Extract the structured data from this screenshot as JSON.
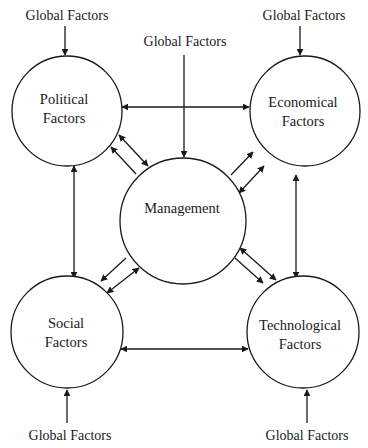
{
  "diagram": {
    "type": "concept-map",
    "nodes": [
      {
        "id": "political",
        "lines": [
          "Political",
          "Factors"
        ],
        "cx": 67,
        "cy": 111,
        "r": 55
      },
      {
        "id": "economical",
        "lines": [
          "Economical",
          "Factors"
        ],
        "cx": 305,
        "cy": 111,
        "r": 55
      },
      {
        "id": "management",
        "lines": [
          "Management"
        ],
        "cx": 183,
        "cy": 221,
        "r": 63
      },
      {
        "id": "social",
        "lines": [
          "Social",
          "Factors"
        ],
        "cx": 67,
        "cy": 332,
        "r": 56
      },
      {
        "id": "technological",
        "lines": [
          "Technological",
          "Factors"
        ],
        "cx": 303,
        "cy": 332,
        "r": 56
      }
    ],
    "external_labels": [
      {
        "id": "global-political",
        "text": "Global Factors",
        "x": 65,
        "y": 22
      },
      {
        "id": "global-management",
        "text": "Global Factors",
        "x": 184,
        "y": 47
      },
      {
        "id": "global-economical",
        "text": "Global Factors",
        "x": 309,
        "y": 22
      },
      {
        "id": "global-social",
        "text": "Global Factors",
        "x": 70,
        "y": 442
      },
      {
        "id": "global-technological",
        "text": "Global Factors",
        "x": 311,
        "y": 442
      }
    ],
    "edges": [
      {
        "from": "global-political",
        "to": "political",
        "direction": "one-way"
      },
      {
        "from": "global-management",
        "to": "management",
        "direction": "one-way"
      },
      {
        "from": "global-economical",
        "to": "economical",
        "direction": "one-way"
      },
      {
        "from": "global-social",
        "to": "social",
        "direction": "one-way"
      },
      {
        "from": "global-technological",
        "to": "technological",
        "direction": "one-way"
      },
      {
        "from": "political",
        "to": "economical",
        "direction": "two-way"
      },
      {
        "from": "social",
        "to": "technological",
        "direction": "two-way"
      },
      {
        "from": "political",
        "to": "social",
        "direction": "two-way"
      },
      {
        "from": "economical",
        "to": "technological",
        "direction": "two-way"
      },
      {
        "from": "management",
        "to": "political",
        "direction": "one-way"
      },
      {
        "from": "political",
        "to": "management",
        "direction": "two-way"
      },
      {
        "from": "management",
        "to": "economical",
        "direction": "one-way"
      },
      {
        "from": "economical",
        "to": "management",
        "direction": "two-way"
      },
      {
        "from": "management",
        "to": "social",
        "direction": "one-way"
      },
      {
        "from": "social",
        "to": "management",
        "direction": "two-way"
      },
      {
        "from": "management",
        "to": "technological",
        "direction": "one-way"
      },
      {
        "from": "technological",
        "to": "management",
        "direction": "two-way"
      }
    ]
  },
  "labels": {
    "global_political": "Global Factors",
    "global_management": "Global Factors",
    "global_economical": "Global Factors",
    "global_social": "Global Factors",
    "global_technological": "Global Factors",
    "political_line1": "Political",
    "political_line2": "Factors",
    "economical_line1": "Economical",
    "economical_line2": "Factors",
    "management": "Management",
    "social_line1": "Social",
    "social_line2": "Factors",
    "technological_line1": "Technological",
    "technological_line2": "Factors"
  }
}
